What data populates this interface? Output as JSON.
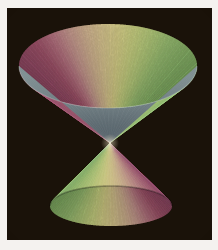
{
  "figure": {
    "background_color": "#1a1209",
    "page_color": "#f4f2ef",
    "border_color": "#b9b4ae",
    "frame": {
      "x": 7,
      "y": 8,
      "width": 205,
      "height": 232
    }
  },
  "chart_data": {
    "type": "surface",
    "subtitle": "",
    "xlabel": "",
    "ylabel": "",
    "zlabel": "",
    "grid": false,
    "legend": null,
    "axes_visible": false,
    "tick_labels": [],
    "annotations": [],
    "surface": {
      "equation": "z^2 = x^2 + y^2",
      "description": "Two nappes of a right circular cone joined at a common apex, rendered on a black background with an angular (azimuthal) rainbow-pastel color map.",
      "apex": {
        "x": 110,
        "y": 143
      },
      "upper_nappe": {
        "rim_center": {
          "x": 108,
          "y": 66
        },
        "rim_radius_x": 89,
        "rim_radius_y": 42,
        "top_y": 25,
        "left_x": 19,
        "right_x": 197,
        "inner_surface_visible": true,
        "inner_surface_color": "#6d7b80"
      },
      "lower_nappe": {
        "base_center": {
          "x": 111,
          "y": 206
        },
        "base_radius_x": 61,
        "base_radius_y": 20,
        "bottom_y": 226,
        "left_x": 50,
        "right_x": 172,
        "inner_surface_visible": false
      }
    },
    "colormap": {
      "name": "pastel-rainbow-azimuthal",
      "mapped_variable": "azimuthal angle (theta)",
      "stops": [
        {
          "position": 0.0,
          "color": "#9e4f72"
        },
        {
          "position": 0.09,
          "color": "#b05a79"
        },
        {
          "position": 0.18,
          "color": "#c87f92"
        },
        {
          "position": 0.27,
          "color": "#dba9a2"
        },
        {
          "position": 0.36,
          "color": "#e7c6a4"
        },
        {
          "position": 0.46,
          "color": "#efdca2"
        },
        {
          "position": 0.56,
          "color": "#eee89a"
        },
        {
          "position": 0.66,
          "color": "#ddea92"
        },
        {
          "position": 0.76,
          "color": "#c3e189"
        },
        {
          "position": 0.86,
          "color": "#a6d480"
        },
        {
          "position": 1.0,
          "color": "#8cc271"
        }
      ]
    }
  }
}
